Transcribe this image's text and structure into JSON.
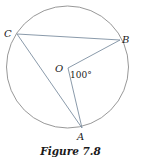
{
  "figure": {
    "caption": "Figure 7.8",
    "circle": {
      "center": [
        67.5,
        67
      ],
      "radius": 61,
      "stroke": "#8c8c8c"
    },
    "points": {
      "O": {
        "label": "O",
        "x": 68,
        "y": 68
      },
      "A": {
        "label": "A",
        "x": 82,
        "y": 128
      },
      "B": {
        "label": "B",
        "x": 120,
        "y": 40
      },
      "C": {
        "label": "C",
        "x": 17,
        "y": 34
      }
    },
    "segments": [
      [
        "C",
        "B"
      ],
      [
        "C",
        "A"
      ],
      [
        "O",
        "B"
      ],
      [
        "O",
        "A"
      ]
    ],
    "angle": {
      "vertex": "O",
      "label": "100°"
    },
    "line_color": "#7d8fa0"
  }
}
